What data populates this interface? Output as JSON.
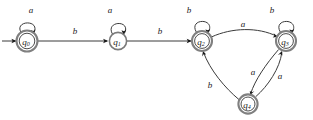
{
  "figure": {
    "kind": "finite-state-automaton-diagram",
    "alphabet": [
      "a",
      "b"
    ],
    "start_state": "q0",
    "accepting_states": [
      "q0",
      "q2",
      "q3",
      "q4"
    ]
  },
  "states": [
    {
      "id": "q0",
      "label": "q",
      "sub": "0",
      "accepting": true,
      "cx": 27,
      "cy": 41,
      "r_outer": 10.5,
      "r_inner": 7.8
    },
    {
      "id": "q1",
      "label": "q",
      "sub": "1",
      "accepting": false,
      "cx": 118,
      "cy": 41,
      "r_outer": 8.6,
      "r_inner": 0
    },
    {
      "id": "q2",
      "label": "q",
      "sub": "2",
      "accepting": true,
      "cx": 202,
      "cy": 41,
      "r_outer": 10.0,
      "r_inner": 7.4
    },
    {
      "id": "q3",
      "label": "q",
      "sub": "3",
      "accepting": true,
      "cx": 286,
      "cy": 41,
      "r_outer": 10.0,
      "r_inner": 7.4
    },
    {
      "id": "q4",
      "label": "q",
      "sub": "4",
      "accepting": true,
      "cx": 248,
      "cy": 104,
      "r_outer": 9.6,
      "r_inner": 7.0
    }
  ],
  "transitions": [
    {
      "id": "t-start",
      "from": "",
      "to": "q0",
      "symbol": "",
      "kind": "start-arrow"
    },
    {
      "id": "t-q0-q0",
      "from": "q0",
      "to": "q0",
      "symbol": "a",
      "kind": "self-loop",
      "label_x": 31,
      "label_y": 10
    },
    {
      "id": "t-q0-q1",
      "from": "q0",
      "to": "q1",
      "symbol": "b",
      "kind": "straight",
      "label_x": 75,
      "label_y": 31
    },
    {
      "id": "t-q1-q1",
      "from": "q1",
      "to": "q1",
      "symbol": "a",
      "kind": "self-loop",
      "label_x": 110,
      "label_y": 10
    },
    {
      "id": "t-q1-q2",
      "from": "q1",
      "to": "q2",
      "symbol": "b",
      "kind": "straight",
      "label_x": 160,
      "label_y": 31
    },
    {
      "id": "t-q2-q2",
      "from": "q2",
      "to": "q2",
      "symbol": "b",
      "kind": "self-loop",
      "label_x": 189,
      "label_y": 10
    },
    {
      "id": "t-q2-q3",
      "from": "q2",
      "to": "q3",
      "symbol": "a",
      "kind": "curve",
      "label_x": 243,
      "label_y": 24
    },
    {
      "id": "t-q3-q3",
      "from": "q3",
      "to": "q3",
      "symbol": "b",
      "kind": "self-loop",
      "label_x": 272,
      "label_y": 10
    },
    {
      "id": "t-q3-q4",
      "from": "q3",
      "to": "q4",
      "symbol": "a",
      "kind": "curve",
      "label_x": 253,
      "label_y": 72
    },
    {
      "id": "t-q4-q3",
      "from": "q4",
      "to": "q3",
      "symbol": "a",
      "kind": "curve",
      "label_x": 280,
      "label_y": 76
    },
    {
      "id": "t-q4-q2",
      "from": "q4",
      "to": "q2",
      "symbol": "b",
      "kind": "curve",
      "label_x": 210,
      "label_y": 85
    }
  ]
}
